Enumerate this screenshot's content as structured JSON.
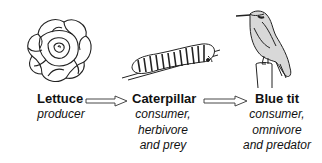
{
  "organisms": [
    {
      "name": "Lettuce",
      "roles": [
        "producer"
      ],
      "icon": "lettuce-icon"
    },
    {
      "name": "Caterpillar",
      "roles": [
        "consumer,",
        "herbivore",
        "and prey"
      ],
      "icon": "caterpillar-icon"
    },
    {
      "name": "Blue tit",
      "roles": [
        "consumer,",
        "omnivore",
        "and predator"
      ],
      "icon": "blue-tit-icon"
    }
  ],
  "links": [
    {
      "from": "Lettuce",
      "to": "Caterpillar"
    },
    {
      "from": "Caterpillar",
      "to": "Blue tit"
    }
  ]
}
